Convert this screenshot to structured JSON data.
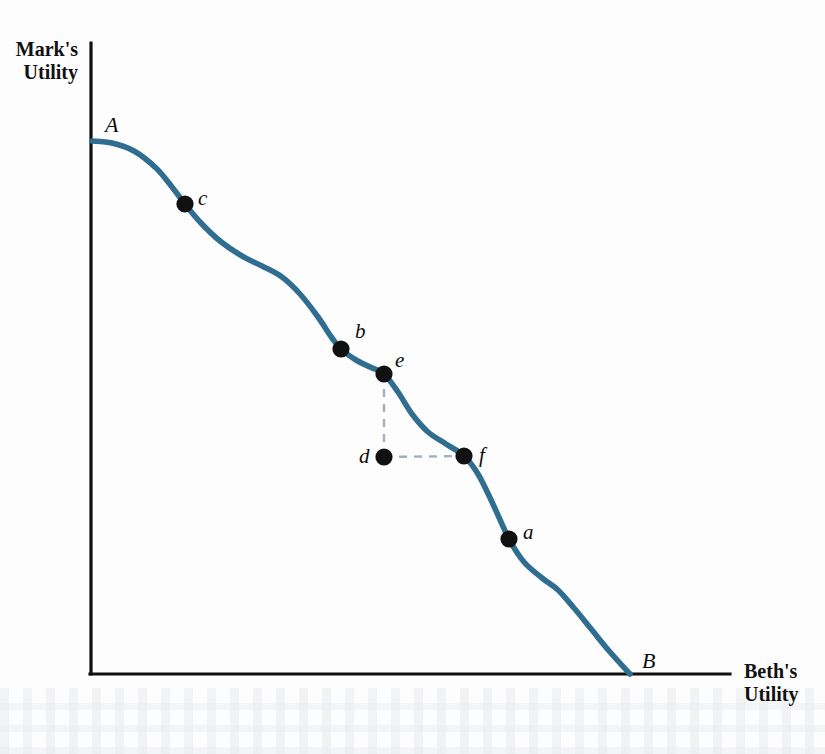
{
  "figure": {
    "background_color": "#fdfdfd",
    "curve_color": "#2f6d91",
    "axis_color": "#101010",
    "dot_color": "#111111",
    "guide_color": "#9fb0c6"
  },
  "axes": {
    "y_title_line1": "Mark's",
    "y_title_line2": "Utility",
    "x_title_line1": "Beth's",
    "x_title_line2": "Utility"
  },
  "labels": {
    "A": "A",
    "B": "B",
    "a": "a",
    "b": "b",
    "c": "c",
    "d": "d",
    "e": "e",
    "f": "f"
  },
  "chart_data": {
    "type": "line",
    "title": "",
    "xlabel": "Beth's Utility",
    "ylabel": "Mark's Utility",
    "grid": false,
    "legend": null,
    "xlim": [
      90,
      730
    ],
    "ylim": [
      674,
      43
    ],
    "axis_units": "pixels (unlabeled qualitative axes)",
    "series": [
      {
        "name": "Utility possibilities frontier",
        "color": "#2f6d91",
        "x": [
          92,
          112,
          134,
          156,
          172,
          185,
          201,
          220,
          242,
          262,
          282,
          300,
          318,
          332,
          341,
          356,
          370,
          384,
          398,
          412,
          428,
          446,
          464,
          478,
          492,
          509,
          524,
          542,
          558,
          574,
          592,
          610,
          630
        ],
        "y": [
          141,
          143,
          151,
          168,
          187,
          204,
          223,
          241,
          256,
          266,
          277,
          294,
          317,
          338,
          349,
          360,
          367,
          374,
          392,
          414,
          432,
          444,
          456,
          474,
          502,
          539,
          562,
          578,
          590,
          608,
          630,
          652,
          674
        ]
      }
    ],
    "points": [
      {
        "id": "A",
        "label": "A",
        "x": 92,
        "y": 141,
        "marker": "none",
        "label_dx": 13,
        "label_dy": -16,
        "is_endpoint": true
      },
      {
        "id": "c",
        "label": "c",
        "x": 185,
        "y": 204,
        "marker": "dot",
        "label_dx": 13,
        "label_dy": -5,
        "is_endpoint": false
      },
      {
        "id": "b",
        "label": "b",
        "x": 341,
        "y": 349,
        "marker": "dot",
        "label_dx": 14,
        "label_dy": -17,
        "is_endpoint": false
      },
      {
        "id": "e",
        "label": "e",
        "x": 384,
        "y": 374,
        "marker": "dot",
        "label_dx": 11,
        "label_dy": -13,
        "is_endpoint": false
      },
      {
        "id": "d",
        "label": "d",
        "x": 384,
        "y": 457,
        "marker": "dot",
        "label_dx": -25,
        "label_dy": 0,
        "is_endpoint": false
      },
      {
        "id": "f",
        "label": "f",
        "x": 464,
        "y": 456,
        "marker": "dot",
        "label_dx": 15,
        "label_dy": 0,
        "is_endpoint": false
      },
      {
        "id": "a",
        "label": "a",
        "x": 509,
        "y": 539,
        "marker": "dot",
        "label_dx": 14,
        "label_dy": -6,
        "is_endpoint": false
      },
      {
        "id": "B",
        "label": "B",
        "x": 630,
        "y": 674,
        "marker": "none",
        "label_dx": 12,
        "label_dy": -13,
        "is_endpoint": true
      }
    ],
    "guides": [
      {
        "name": "e-to-d-vertical",
        "x1": 384,
        "y1": 374,
        "x2": 384,
        "y2": 457,
        "style": "dashed"
      },
      {
        "name": "d-to-f-horizontal",
        "x1": 384,
        "y1": 457,
        "x2": 464,
        "y2": 456,
        "style": "dashed"
      }
    ],
    "annotations": [
      "Point A: all utility to Mark",
      "Point B: all utility to Beth",
      "Point d lies inside the frontier (inefficient)"
    ]
  }
}
